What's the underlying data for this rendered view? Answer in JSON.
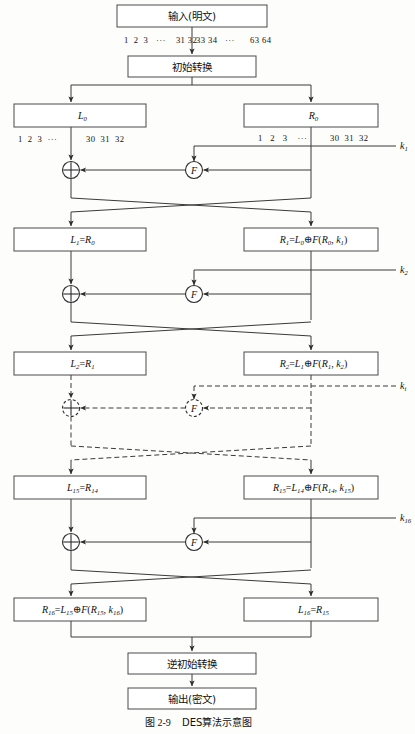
{
  "figure": {
    "caption_label": "图 2-9",
    "caption_text": "DES算法示意图"
  },
  "boxes": {
    "input": "输入(明文)",
    "initial_permutation": "初始转换",
    "L0": "L0",
    "R0": "R0",
    "L1": "L1=R0",
    "R1": "R1=L0⊕F(R0, k1)",
    "L2": "L2=R1",
    "R2": "R2=L1⊕F(R1, k2)",
    "L15": "L15=R14",
    "R15": "R15=L14⊕F(R14, k15)",
    "R16": "R16=L15⊕F(R15, k16)",
    "L16": "L16=R15",
    "inverse_permutation": "逆初始转换",
    "output": "输出(密文)"
  },
  "bit_labels": {
    "input_left": "1  2  3   ···    31 32",
    "input_right": "33 34   ···      63 64",
    "L0_left": "1  2  3  ···",
    "L0_right": "30  31  32",
    "R0_left": "1   2   3    ···",
    "R0_right": "30  31  32"
  },
  "keys": {
    "k1": "k1",
    "k2": "k2",
    "ki": "ki",
    "k16": "k16"
  },
  "symbols": {
    "xor": "⊕",
    "function": "F"
  },
  "colors": {
    "stroke": "#3a3a3a",
    "box_stroke": "#4a4a4a",
    "background": "#fdfdfc",
    "text": "#111111"
  }
}
